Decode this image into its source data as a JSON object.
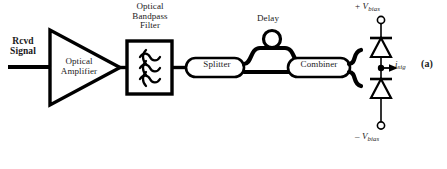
{
  "figure": {
    "panel_label": "(a)",
    "caption_cut_top": "· ·   ·",
    "background_color": "#ffffff",
    "line_color": "#000000"
  },
  "blocks": {
    "input_label": "Rcvd\nSignal",
    "amplifier_label": "Optical\nAmplifier",
    "filter_label": "Optical\nBandpass\nFilter",
    "splitter_label": "Splitter",
    "delay_label": "Delay",
    "combiner_label": "Combiner"
  },
  "electrical": {
    "bias_top_sign": "+",
    "bias_top_symbol": "V",
    "bias_top_subscript": "bias",
    "bias_bottom_sign": "–",
    "bias_bottom_symbol": "V",
    "bias_bottom_subscript": "bias",
    "current_symbol": "i",
    "current_subscript": "sig"
  }
}
